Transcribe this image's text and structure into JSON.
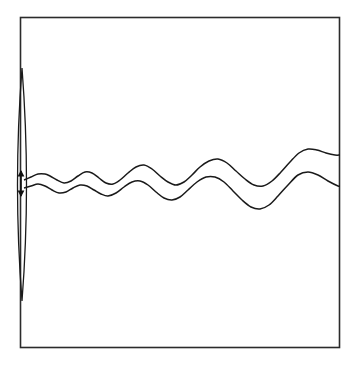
{
  "figure": {
    "title": "Wave propagation from an oscillating source",
    "background_color": "#ffffff",
    "stroke_color": "#1a1a1a",
    "frame_color": "#2b2b2b",
    "width": 358,
    "height": 367
  },
  "chart_data": {
    "type": "line",
    "title": "Wave propagation from an oscillating source",
    "subtitle": "",
    "xlabel": "",
    "ylabel": "",
    "xlim": [
      20,
      340
    ],
    "ylim": [
      17,
      348
    ],
    "grid": false,
    "legend": false,
    "legend_position": "none",
    "annotations": [
      {
        "name": "oscillation-arrow",
        "kind": "double-headed-vertical-arrow",
        "x": 21,
        "y_top": 170,
        "y_bottom": 197,
        "label": ""
      },
      {
        "name": "source-lens",
        "kind": "narrow-vertical-lens",
        "x_center": 22,
        "y_top": 68,
        "y_bottom": 301,
        "half_width": 4.5,
        "label": ""
      }
    ],
    "series": [
      {
        "name": "upper-wavefront",
        "comment": "Crest-leading wave train, amplitude and wavelength both grow to the right",
        "x": [
          24,
          31,
          38,
          45,
          50,
          57,
          64,
          71,
          78,
          85,
          92,
          99,
          106,
          113,
          120,
          128,
          136,
          144,
          152,
          160,
          168,
          176,
          184,
          192,
          200,
          209,
          218,
          227,
          236,
          245,
          254,
          263,
          272,
          281,
          290,
          299,
          308,
          317,
          326,
          335,
          340
        ],
        "y": [
          180,
          177,
          174,
          174,
          176,
          180,
          183,
          181,
          176,
          172,
          173,
          178,
          183,
          184,
          180,
          173,
          167,
          165,
          169,
          176,
          182,
          185,
          182,
          175,
          167,
          161,
          159,
          163,
          171,
          179,
          185,
          186,
          181,
          172,
          162,
          153,
          149,
          150,
          153,
          155,
          155
        ]
      },
      {
        "name": "lower-wavefront",
        "comment": "Trailing wave train, same phase structure shifted down and slightly delayed",
        "x": [
          24,
          31,
          38,
          45,
          52,
          59,
          66,
          73,
          80,
          87,
          94,
          101,
          108,
          116,
          124,
          132,
          140,
          148,
          156,
          164,
          172,
          180,
          188,
          197,
          206,
          215,
          224,
          233,
          242,
          251,
          260,
          269,
          278,
          288,
          298,
          308,
          318,
          328,
          338,
          340
        ],
        "y": [
          188,
          186,
          184,
          186,
          190,
          193,
          192,
          188,
          185,
          186,
          190,
          194,
          196,
          193,
          187,
          182,
          181,
          185,
          192,
          198,
          200,
          197,
          190,
          182,
          177,
          177,
          182,
          191,
          200,
          207,
          209,
          205,
          196,
          185,
          175,
          172,
          175,
          181,
          186,
          186
        ]
      }
    ]
  }
}
